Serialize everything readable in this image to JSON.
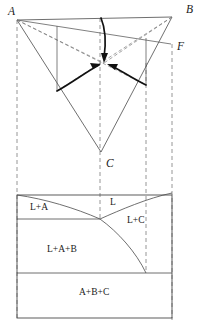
{
  "figure": {
    "type": "phase-diagram",
    "width": 199,
    "height": 328
  },
  "colors": {
    "line": "#4a4a4a",
    "bold_line": "#111111",
    "dashed_line": "#8a8a8a",
    "text": "#1a1a1a",
    "background": "#ffffff"
  },
  "ternary": {
    "corner_labels": [
      {
        "id": "A",
        "text": "A",
        "x": 8,
        "y": 15
      },
      {
        "id": "B",
        "text": "B",
        "x": 186,
        "y": 13
      },
      {
        "id": "C",
        "text": "C",
        "x": 106,
        "y": 167
      }
    ],
    "point_labels": [
      {
        "id": "F",
        "text": "F",
        "x": 177,
        "y": 50
      }
    ],
    "vertices": {
      "A": {
        "x": 17,
        "y": 20
      },
      "B": {
        "x": 172,
        "y": 17
      },
      "C": {
        "x": 101,
        "y": 152
      }
    },
    "ternary_eutectic": {
      "x": 104,
      "y": 63
    },
    "binary_eutectics": [
      {
        "id": "e_AB",
        "x": 101,
        "y": 18
      },
      {
        "id": "e_AC",
        "x": 57,
        "y": 91
      },
      {
        "id": "e_BC",
        "x": 146,
        "y": 85
      }
    ],
    "section_point_F": {
      "x": 171,
      "y": 44
    },
    "section_line": {
      "from": "A",
      "to": "F"
    }
  },
  "isopleth": {
    "box": {
      "left": 17,
      "right": 172,
      "top": 195,
      "bottom": 318
    },
    "fields": [
      {
        "id": "L",
        "label": "L",
        "x": 110,
        "y": 205
      },
      {
        "id": "L+A",
        "label": "L+A",
        "x": 30,
        "y": 210
      },
      {
        "id": "L+C",
        "label": "L+C",
        "x": 127,
        "y": 223
      },
      {
        "id": "L+A+B",
        "label": "L+A+B",
        "x": 47,
        "y": 252
      },
      {
        "id": "A+B+C",
        "label": "A+B+C",
        "x": 79,
        "y": 295
      }
    ],
    "horizontal_boundaries": [
      {
        "id": "eutectic-trough-left",
        "y": 219,
        "x1": 17,
        "x2": 100
      },
      {
        "id": "ternary-eutectic-isotherm",
        "y": 273,
        "x1": 17,
        "x2": 172
      }
    ]
  },
  "projection_lines": [
    {
      "id": "proj-A",
      "x": 17
    },
    {
      "id": "proj-eAB",
      "x": 100
    },
    {
      "id": "proj-eBC",
      "x": 146
    },
    {
      "id": "proj-F",
      "x": 172
    }
  ]
}
